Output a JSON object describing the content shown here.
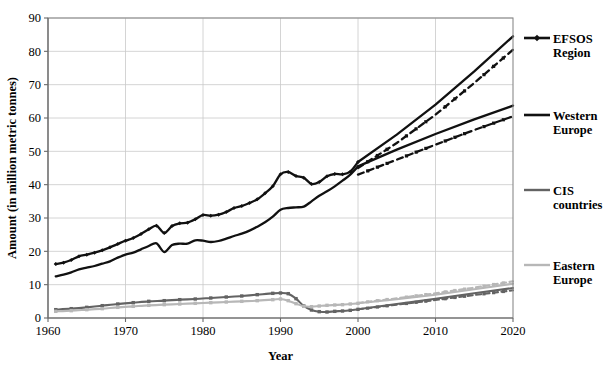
{
  "chart_data": {
    "type": "line",
    "title": "",
    "xlabel": "Year",
    "ylabel": "Amount (in million metric tonnes)",
    "xlim": [
      1960,
      2020
    ],
    "ylim": [
      0,
      90
    ],
    "xticks": [
      1960,
      1970,
      1980,
      1990,
      2000,
      2010,
      2020
    ],
    "yticks": [
      0,
      10,
      20,
      30,
      40,
      50,
      60,
      70,
      80,
      90
    ],
    "grid": "horizontal-and-vertical",
    "legend_position": "right",
    "history_end_year": 2000,
    "colors": {
      "efsos_region": "#111111",
      "western_europe": "#111111",
      "cis_countries": "#636363",
      "eastern_europe": "#b7b7b7",
      "gridline": "#c9c9c9",
      "frame": "#8a8a8a"
    },
    "series": [
      {
        "name": "EFSOS Region",
        "color": "#111111",
        "marker": "diamond",
        "style": "solid-with-markers",
        "x": [
          1961,
          1962,
          1963,
          1964,
          1965,
          1966,
          1967,
          1968,
          1969,
          1970,
          1971,
          1972,
          1973,
          1974,
          1975,
          1976,
          1977,
          1978,
          1979,
          1980,
          1981,
          1982,
          1983,
          1984,
          1985,
          1986,
          1987,
          1988,
          1989,
          1990,
          1991,
          1992,
          1993,
          1994,
          1995,
          1996,
          1997,
          1998,
          1999,
          2000
        ],
        "values": [
          16.2,
          16.6,
          17.4,
          18.5,
          19.0,
          19.6,
          20.3,
          21.2,
          22.2,
          23.2,
          24.0,
          25.2,
          26.6,
          27.7,
          25.5,
          27.6,
          28.4,
          28.6,
          29.6,
          30.9,
          30.7,
          31.0,
          31.8,
          33.0,
          33.6,
          34.5,
          35.6,
          37.4,
          39.5,
          43.1,
          43.8,
          42.6,
          42.1,
          40.2,
          40.8,
          42.5,
          43.2,
          43.1,
          43.9,
          46.8
        ]
      },
      {
        "name": "EFSOS Region",
        "color": "#111111",
        "style": "projection-solid-upper",
        "scenario": "upper",
        "x": [
          2000,
          2005,
          2010,
          2015,
          2020
        ],
        "values": [
          46.8,
          55.0,
          64.0,
          74.0,
          84.5
        ]
      },
      {
        "name": "EFSOS Region",
        "color": "#111111",
        "style": "projection-dashed-lower",
        "scenario": "lower",
        "x": [
          2000,
          2005,
          2010,
          2015,
          2020
        ],
        "values": [
          45.0,
          52.5,
          61.0,
          70.5,
          80.5
        ]
      },
      {
        "name": "Western Europe",
        "color": "#111111",
        "marker": "none",
        "style": "solid",
        "x": [
          1961,
          1962,
          1963,
          1964,
          1965,
          1966,
          1967,
          1968,
          1969,
          1970,
          1971,
          1972,
          1973,
          1974,
          1975,
          1976,
          1977,
          1978,
          1979,
          1980,
          1981,
          1982,
          1983,
          1984,
          1985,
          1986,
          1987,
          1988,
          1989,
          1990,
          1991,
          1992,
          1993,
          1994,
          1995,
          1996,
          1997,
          1998,
          1999,
          2000
        ],
        "values": [
          12.5,
          13.0,
          13.7,
          14.6,
          15.1,
          15.6,
          16.3,
          17.0,
          18.1,
          19.0,
          19.6,
          20.6,
          21.6,
          22.4,
          19.8,
          21.9,
          22.3,
          22.3,
          23.3,
          23.2,
          22.8,
          23.1,
          23.8,
          24.6,
          25.3,
          26.2,
          27.4,
          28.7,
          30.4,
          32.5,
          33.0,
          33.2,
          33.4,
          35.0,
          36.7,
          38.0,
          39.5,
          41.2,
          43.0,
          45.5
        ]
      },
      {
        "name": "Western Europe",
        "color": "#111111",
        "style": "projection-solid-upper",
        "scenario": "upper",
        "x": [
          2000,
          2005,
          2010,
          2015,
          2020
        ],
        "values": [
          45.5,
          50.5,
          55.2,
          59.6,
          63.7
        ]
      },
      {
        "name": "Western Europe",
        "color": "#111111",
        "style": "projection-dashed-lower",
        "scenario": "lower",
        "x": [
          2000,
          2005,
          2010,
          2015,
          2020
        ],
        "values": [
          43.0,
          47.5,
          52.0,
          56.4,
          60.5
        ]
      },
      {
        "name": "CIS countries",
        "color": "#636363",
        "marker": "square",
        "style": "solid-with-markers",
        "x": [
          1961,
          1963,
          1965,
          1967,
          1969,
          1971,
          1973,
          1975,
          1977,
          1979,
          1981,
          1983,
          1985,
          1987,
          1989,
          1990,
          1991,
          1992,
          1993,
          1994,
          1995,
          1996,
          1997,
          1998,
          1999,
          2000
        ],
        "values": [
          2.5,
          2.8,
          3.2,
          3.7,
          4.2,
          4.6,
          5.0,
          5.2,
          5.5,
          5.7,
          6.0,
          6.3,
          6.6,
          7.0,
          7.4,
          7.5,
          7.3,
          5.8,
          3.6,
          2.4,
          1.9,
          1.8,
          2.0,
          2.1,
          2.3,
          2.6
        ]
      },
      {
        "name": "CIS countries",
        "color": "#636363",
        "style": "projection-solid-upper",
        "scenario": "upper",
        "x": [
          2000,
          2005,
          2010,
          2015,
          2020
        ],
        "values": [
          2.6,
          4.2,
          5.8,
          7.4,
          9.0
        ]
      },
      {
        "name": "CIS countries",
        "color": "#636363",
        "style": "projection-dashed-lower",
        "scenario": "lower",
        "x": [
          2000,
          2005,
          2010,
          2015,
          2020
        ],
        "values": [
          2.6,
          4.0,
          5.4,
          6.9,
          8.3
        ]
      },
      {
        "name": "Eastern Europe",
        "color": "#b7b7b7",
        "marker": "square",
        "style": "solid-with-markers",
        "x": [
          1961,
          1963,
          1965,
          1967,
          1969,
          1971,
          1973,
          1975,
          1977,
          1979,
          1981,
          1983,
          1985,
          1987,
          1989,
          1990,
          1991,
          1992,
          1993,
          1994,
          1995,
          1996,
          1997,
          1998,
          1999,
          2000
        ],
        "values": [
          2.0,
          2.2,
          2.5,
          2.8,
          3.2,
          3.5,
          3.8,
          4.0,
          4.2,
          4.4,
          4.6,
          4.8,
          5.0,
          5.2,
          5.5,
          5.7,
          5.2,
          4.3,
          3.5,
          3.4,
          3.6,
          3.8,
          3.9,
          4.0,
          4.2,
          4.4
        ]
      },
      {
        "name": "Eastern Europe",
        "color": "#b7b7b7",
        "style": "projection-solid-upper",
        "scenario": "upper",
        "x": [
          2000,
          2005,
          2010,
          2015,
          2020
        ],
        "values": [
          4.4,
          5.6,
          7.0,
          8.6,
          10.3
        ]
      },
      {
        "name": "Eastern Europe",
        "color": "#b7b7b7",
        "style": "projection-dashed-lower",
        "scenario": "lower",
        "x": [
          2000,
          2005,
          2010,
          2015,
          2020
        ],
        "values": [
          4.5,
          5.9,
          7.4,
          9.1,
          11.0
        ]
      }
    ]
  },
  "legend": {
    "items": [
      {
        "label_line1": "EFSOS",
        "label_line2": "Region",
        "color": "#111111",
        "marker": "diamond"
      },
      {
        "label_line1": "Western",
        "label_line2": "Europe",
        "color": "#111111",
        "marker": "none"
      },
      {
        "label_line1": "CIS",
        "label_line2": "countries",
        "color": "#636363",
        "marker": "none"
      },
      {
        "label_line1": "Eastern",
        "label_line2": "Europe",
        "color": "#b7b7b7",
        "marker": "none"
      }
    ]
  },
  "axes": {
    "x_title": "Year",
    "y_title": "Amount (in million metric tonnes)",
    "x_tick_labels": [
      "1960",
      "1970",
      "1980",
      "1990",
      "2000",
      "2010",
      "2020"
    ],
    "y_tick_labels": [
      "0",
      "10",
      "20",
      "30",
      "40",
      "50",
      "60",
      "70",
      "80",
      "90"
    ]
  }
}
